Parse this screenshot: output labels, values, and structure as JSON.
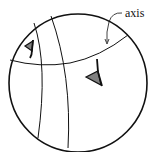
{
  "diagram": {
    "title": "",
    "labels": {
      "axis": "axis"
    },
    "colors": {
      "stroke": "#111111",
      "marker_fill": "#808080",
      "background": "#ffffff"
    },
    "elements": [
      {
        "name": "sphere-outline",
        "type": "circle"
      },
      {
        "name": "axis-curve",
        "type": "curve"
      },
      {
        "name": "meridian-left",
        "type": "curve"
      },
      {
        "name": "meridian-right",
        "type": "curve"
      },
      {
        "name": "marker-left",
        "type": "triangle-marker"
      },
      {
        "name": "marker-right",
        "type": "triangle-marker"
      }
    ]
  }
}
